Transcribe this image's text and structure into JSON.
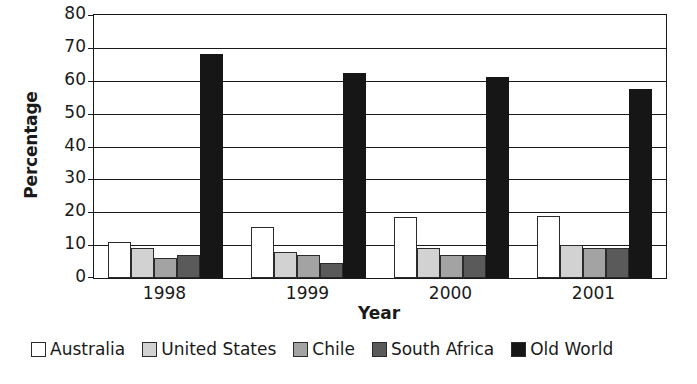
{
  "chart_data": {
    "type": "bar",
    "title": "",
    "subtitle": "",
    "xlabel": "Year",
    "ylabel": "Percentage",
    "categories": [
      "1998",
      "1999",
      "2000",
      "2001"
    ],
    "ylim": [
      0,
      80
    ],
    "ytick_labels": [
      "80",
      "70",
      "60",
      "50",
      "40",
      "30",
      "20",
      "10",
      "0"
    ],
    "ytick_values": [
      80,
      70,
      60,
      50,
      40,
      30,
      20,
      10,
      0
    ],
    "grid": true,
    "grid_axis": "y",
    "legend_position": "bottom-left",
    "series": [
      {
        "name": "Australia",
        "color": "#ffffff",
        "values": [
          11,
          15.5,
          18.5,
          19
        ]
      },
      {
        "name": "United States",
        "color": "#d2d2d2",
        "values": [
          9,
          8,
          9,
          10
        ]
      },
      {
        "name": "Chile",
        "color": "#a3a3a3",
        "values": [
          6,
          7,
          7,
          9
        ]
      },
      {
        "name": "South Africa",
        "color": "#5a5a5a",
        "values": [
          7,
          4.5,
          7,
          9
        ]
      },
      {
        "name": "Old World",
        "color": "#161616",
        "values": [
          68,
          62.5,
          61,
          57.5
        ]
      }
    ]
  }
}
